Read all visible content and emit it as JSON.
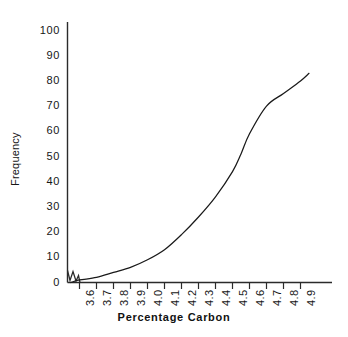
{
  "chart_data": {
    "type": "line",
    "title": "",
    "subtitle": "",
    "xlabel": "Percentage  Carbon",
    "ylabel": "Frequency",
    "grid": false,
    "legend": null,
    "axis_break_at_origin": true,
    "xlim": [
      3.55,
      4.95
    ],
    "ylim": [
      0,
      100
    ],
    "x_tick_labels": [
      "3.6",
      "3.7",
      "3.8",
      "3.9",
      "4.0",
      "4.1",
      "4.2",
      "4.3",
      "4.4",
      "4.5",
      "4.6",
      "4.7",
      "4.8",
      "4.9"
    ],
    "x_tick_values": [
      3.6,
      3.7,
      3.8,
      3.9,
      4.0,
      4.1,
      4.2,
      4.3,
      4.4,
      4.5,
      4.6,
      4.7,
      4.8,
      4.9
    ],
    "y_tick_labels": [
      "0",
      "10",
      "20",
      "30",
      "40",
      "50",
      "60",
      "70",
      "80",
      "90",
      "100"
    ],
    "y_tick_values": [
      0,
      10,
      20,
      30,
      40,
      50,
      60,
      70,
      80,
      90,
      100
    ],
    "line_color": "#1a1a1a",
    "axis_color": "#2b2b2b",
    "series": [
      {
        "name": "Cumulative frequency",
        "x": [
          3.55,
          3.6,
          3.7,
          3.8,
          3.9,
          4.0,
          4.1,
          4.2,
          4.3,
          4.4,
          4.5,
          4.55,
          4.6,
          4.7,
          4.8,
          4.9,
          4.95
        ],
        "values": [
          0,
          1,
          2,
          4,
          6,
          9,
          13,
          19,
          26,
          34,
          44,
          51,
          59,
          70,
          75,
          80,
          83
        ]
      }
    ]
  }
}
